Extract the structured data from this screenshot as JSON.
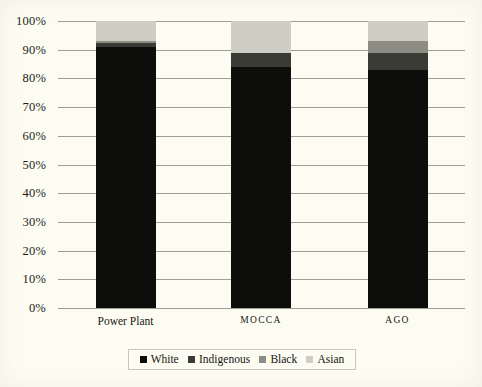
{
  "chart_data": {
    "type": "bar",
    "subtype": "stacked-100-percent",
    "title": "",
    "xlabel": "",
    "ylabel": "",
    "ylim": [
      0,
      100
    ],
    "ytick_labels": [
      "100%",
      "90%",
      "80%",
      "70%",
      "60%",
      "50%",
      "40%",
      "30%",
      "20%",
      "10%",
      "0%"
    ],
    "ytick_values": [
      100,
      90,
      80,
      70,
      60,
      50,
      40,
      30,
      20,
      10,
      0
    ],
    "grid": true,
    "legend_position": "bottom",
    "categories": [
      "Power Plant",
      "MOCCA",
      "AGO"
    ],
    "series": [
      {
        "name": "White",
        "color": "#0d0d0b",
        "values": [
          91,
          84,
          83
        ]
      },
      {
        "name": "Indigenous",
        "color": "#3b3b36",
        "values": [
          1.5,
          5,
          6
        ]
      },
      {
        "name": "Black",
        "color": "#8d8d84",
        "values": [
          0.5,
          0,
          4
        ]
      },
      {
        "name": "Asian",
        "color": "#cfcec4",
        "values": [
          7,
          11,
          7
        ]
      }
    ]
  },
  "axis": {
    "ticks": [
      {
        "label": "100%",
        "value": 100
      },
      {
        "label": "90%",
        "value": 90
      },
      {
        "label": "80%",
        "value": 80
      },
      {
        "label": "70%",
        "value": 70
      },
      {
        "label": "60%",
        "value": 60
      },
      {
        "label": "50%",
        "value": 50
      },
      {
        "label": "40%",
        "value": 40
      },
      {
        "label": "30%",
        "value": 30
      },
      {
        "label": "20%",
        "value": 20
      },
      {
        "label": "10%",
        "value": 10
      },
      {
        "label": "0%",
        "value": 0
      }
    ]
  },
  "categories": [
    {
      "label": "Power Plant",
      "style": "normal"
    },
    {
      "label": "MOCCA",
      "style": "smallcaps"
    },
    {
      "label": "AGO",
      "style": "smallcaps"
    }
  ],
  "legend": {
    "items": [
      {
        "label": "White",
        "color": "#0d0d0b"
      },
      {
        "label": "Indigenous",
        "color": "#3b3b36"
      },
      {
        "label": "Black",
        "color": "#8d8d84"
      },
      {
        "label": "Asian",
        "color": "#cfcec4"
      }
    ]
  },
  "colors": {
    "background": "#fdfcf3",
    "gridline": "#9e9e92",
    "text": "#1a1a18"
  }
}
